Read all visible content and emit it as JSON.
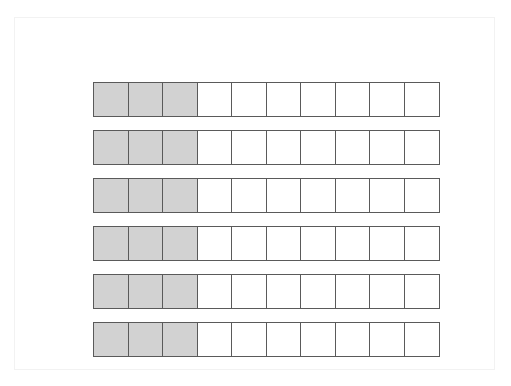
{
  "figure": {
    "frame_color": "#f2f2f2",
    "background_color": "#ffffff"
  },
  "chart_data": {
    "type": "bar",
    "xlabel": "",
    "ylabel": "",
    "grid": false,
    "legend_position": "none",
    "cells_per_bar": 10,
    "shaded_cells_per_bar": 3,
    "fraction_value": "3/10",
    "decimal_value": 0.3,
    "percent_value": 30,
    "bar_count": 6,
    "categories": [
      "Bar 1",
      "Bar 2",
      "Bar 3",
      "Bar 4",
      "Bar 5",
      "Bar 6"
    ],
    "values": [
      3,
      3,
      3,
      3,
      3,
      3
    ],
    "ylim": [
      0,
      10
    ],
    "colors": {
      "shaded_cell": "#d2d2d2",
      "unshaded_cell": "#ffffff",
      "cell_border": "#5a5a5a"
    },
    "bars": [
      {
        "label": "Bar 1",
        "shaded": 3,
        "total": 10,
        "cells": [
          "shaded",
          "shaded",
          "shaded",
          "empty",
          "empty",
          "empty",
          "empty",
          "empty",
          "empty",
          "empty"
        ]
      },
      {
        "label": "Bar 2",
        "shaded": 3,
        "total": 10,
        "cells": [
          "shaded",
          "shaded",
          "shaded",
          "empty",
          "empty",
          "empty",
          "empty",
          "empty",
          "empty",
          "empty"
        ]
      },
      {
        "label": "Bar 3",
        "shaded": 3,
        "total": 10,
        "cells": [
          "shaded",
          "shaded",
          "shaded",
          "empty",
          "empty",
          "empty",
          "empty",
          "empty",
          "empty",
          "empty"
        ]
      },
      {
        "label": "Bar 4",
        "shaded": 3,
        "total": 10,
        "cells": [
          "shaded",
          "shaded",
          "shaded",
          "empty",
          "empty",
          "empty",
          "empty",
          "empty",
          "empty",
          "empty"
        ]
      },
      {
        "label": "Bar 5",
        "shaded": 3,
        "total": 10,
        "cells": [
          "shaded",
          "shaded",
          "shaded",
          "empty",
          "empty",
          "empty",
          "empty",
          "empty",
          "empty",
          "empty"
        ]
      },
      {
        "label": "Bar 6",
        "shaded": 3,
        "total": 10,
        "cells": [
          "shaded",
          "shaded",
          "shaded",
          "empty",
          "empty",
          "empty",
          "empty",
          "empty",
          "empty",
          "empty"
        ]
      }
    ]
  }
}
